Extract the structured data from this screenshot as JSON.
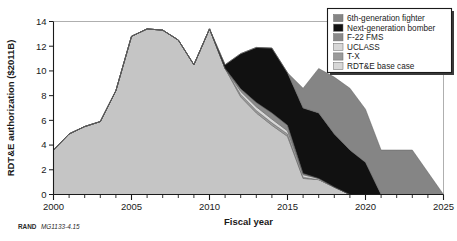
{
  "figure": {
    "credit_label": "RAND",
    "credit_id": "MG1133-4.15"
  },
  "chart_data": {
    "type": "area",
    "stacked": true,
    "title": "",
    "xlabel": "Fiscal year",
    "ylabel": "RDT&E authorization ($2011B)",
    "xlim": [
      2000,
      2025
    ],
    "ylim": [
      0,
      14
    ],
    "xticks": [
      2000,
      2005,
      2010,
      2015,
      2020,
      2025
    ],
    "xtick_labels": [
      "2000",
      "2005",
      "2010",
      "2015",
      "2020",
      "2025"
    ],
    "yticks": [
      0,
      2,
      4,
      6,
      8,
      10,
      12,
      14
    ],
    "ytick_labels": [
      "0",
      "2",
      "4",
      "6",
      "8",
      "10",
      "12",
      "14"
    ],
    "minor_xtick_interval": 1,
    "grid": false,
    "legend_position": "top-right",
    "x": [
      2000,
      2001,
      2002,
      2003,
      2004,
      2005,
      2006,
      2007,
      2008,
      2009,
      2010,
      2011,
      2012,
      2013,
      2014,
      2015,
      2016,
      2017,
      2018,
      2019,
      2020,
      2021,
      2022,
      2023,
      2024,
      2025
    ],
    "series": [
      {
        "name": "RDT&E base case",
        "color": "#c5c5c5",
        "values": [
          3.6,
          4.9,
          5.5,
          5.9,
          8.4,
          12.8,
          13.4,
          13.3,
          12.5,
          10.5,
          13.4,
          10.2,
          7.9,
          6.6,
          5.6,
          4.7,
          1.3,
          1.2,
          0.6,
          0.0,
          0.0,
          0.0,
          0.0,
          0.0,
          0.0,
          0.0
        ]
      },
      {
        "name": "T-X",
        "color": "#9a9a9a",
        "values": [
          0.0,
          0.0,
          0.0,
          0.0,
          0.0,
          0.0,
          0.0,
          0.0,
          0.0,
          0.0,
          0.0,
          0.0,
          0.2,
          0.2,
          0.2,
          0.2,
          0.1,
          0.0,
          0.0,
          0.0,
          0.0,
          0.0,
          0.0,
          0.0,
          0.0,
          0.0
        ]
      },
      {
        "name": "UCLASS",
        "color": "#d7d7d7",
        "values": [
          0.0,
          0.0,
          0.0,
          0.0,
          0.0,
          0.0,
          0.0,
          0.0,
          0.0,
          0.0,
          0.0,
          0.0,
          0.25,
          0.3,
          0.3,
          0.25,
          0.2,
          0.1,
          0.0,
          0.0,
          0.0,
          0.0,
          0.0,
          0.0,
          0.0,
          0.0
        ]
      },
      {
        "name": "F-22 FMS",
        "color": "#8a8a8a",
        "values": [
          0.0,
          0.0,
          0.0,
          0.0,
          0.0,
          0.0,
          0.0,
          0.0,
          0.0,
          0.0,
          0.0,
          0.0,
          0.2,
          0.35,
          0.5,
          0.45,
          0.1,
          0.0,
          0.0,
          0.0,
          0.0,
          0.0,
          0.0,
          0.0,
          0.0,
          0.0
        ]
      },
      {
        "name": "Next-generation bomber",
        "color": "#111111",
        "values": [
          0.0,
          0.0,
          0.0,
          0.0,
          0.0,
          0.0,
          0.0,
          0.0,
          0.0,
          0.0,
          0.0,
          0.3,
          2.85,
          4.45,
          5.25,
          4.25,
          5.3,
          5.3,
          4.3,
          3.6,
          2.6,
          0.0,
          0.0,
          0.0,
          0.0,
          0.0
        ]
      },
      {
        "name": "6th-generation fighter",
        "color": "#858585",
        "values": [
          0.0,
          0.0,
          0.0,
          0.0,
          0.0,
          0.0,
          0.0,
          0.0,
          0.0,
          0.0,
          0.0,
          0.0,
          0.0,
          0.0,
          0.0,
          0.0,
          1.6,
          3.6,
          4.6,
          5.0,
          4.3,
          3.6,
          3.6,
          3.6,
          1.8,
          0.0
        ]
      }
    ],
    "legend_entries": [
      {
        "label": "6th-generation fighter",
        "color": "#858585"
      },
      {
        "label": "Next-generation bomber",
        "color": "#111111"
      },
      {
        "label": "F-22 FMS",
        "color": "#8a8a8a"
      },
      {
        "label": "UCLASS",
        "color": "#d7d7d7"
      },
      {
        "label": "T-X",
        "color": "#9a9a9a"
      },
      {
        "label": "RDT&E base case",
        "color": "#d7d7d7"
      }
    ]
  }
}
